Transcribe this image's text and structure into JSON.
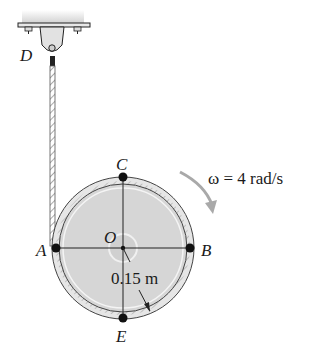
{
  "diagram": {
    "points": {
      "D": "D",
      "C": "C",
      "O": "O",
      "A": "A",
      "B": "B",
      "E": "E"
    },
    "radius_label": "0.15 m",
    "omega_label": "ω = 4 rad/s",
    "colors": {
      "disk_fill": "#d9d9d9",
      "rim": "#b5b5b5",
      "line": "#222222",
      "arrow": "#a9a9a9"
    }
  }
}
